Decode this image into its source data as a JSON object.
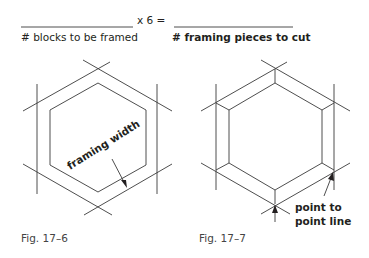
{
  "formula": {
    "left_label": "# blocks to be framed",
    "operator": "x 6 =",
    "right_label": "# framing pieces to cut"
  },
  "figures": [
    {
      "caption": "Fig. 17–6",
      "annotation": "framing width",
      "shape": "hexagon"
    },
    {
      "caption": "Fig. 17–7",
      "annotation_line1": "point to",
      "annotation_line2": "point line",
      "shape": "hexagon"
    }
  ],
  "colors": {
    "line": "#3a3a3a",
    "text": "#231f20"
  }
}
